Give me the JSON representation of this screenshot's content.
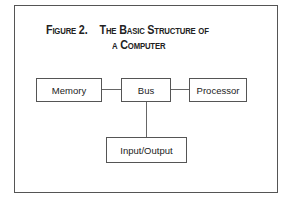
{
  "figure": {
    "label": "Figure 2.",
    "title_line1": "The Basic Structure of",
    "title_line2": "a Computer"
  },
  "nodes": {
    "memory": "Memory",
    "bus": "Bus",
    "processor": "Processor",
    "io": "Input/Output"
  },
  "colors": {
    "line": "#555555",
    "background": "#ffffff"
  }
}
